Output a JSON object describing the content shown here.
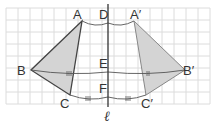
{
  "diagram": {
    "axis_label": "ℓ",
    "grid": {
      "x0": 6,
      "y0": 8,
      "cols": 17,
      "rows": 8,
      "cell": 12,
      "color": "#d8d8d8"
    },
    "colors": {
      "fill": "#d4d4d4",
      "stroke": "#444444",
      "axis": "#333333",
      "grid": "#dcdcdc"
    },
    "points": {
      "A": {
        "label": "A",
        "x": 82,
        "y": 21
      },
      "B": {
        "label": "B",
        "x": 31,
        "y": 70
      },
      "C": {
        "label": "C",
        "x": 70,
        "y": 95
      },
      "A2": {
        "label": "A′",
        "x": 134,
        "y": 21
      },
      "B2": {
        "label": "B′",
        "x": 185,
        "y": 70
      },
      "C2": {
        "label": "C′",
        "x": 146,
        "y": 95
      },
      "D": {
        "label": "D",
        "x": 108,
        "y": 23
      },
      "E": {
        "label": "E",
        "x": 108,
        "y": 72
      },
      "F": {
        "label": "F",
        "x": 108,
        "y": 97
      }
    },
    "triangles": [
      {
        "name": "ABC",
        "vertices": [
          "A",
          "B",
          "C"
        ]
      },
      {
        "name": "A′B′C′",
        "vertices": [
          "A2",
          "B2",
          "C2"
        ]
      }
    ],
    "equal_length_marks": [
      "BE = EB′ (||)",
      "CF = FC′ (|||)",
      "AD = DA′"
    ]
  }
}
